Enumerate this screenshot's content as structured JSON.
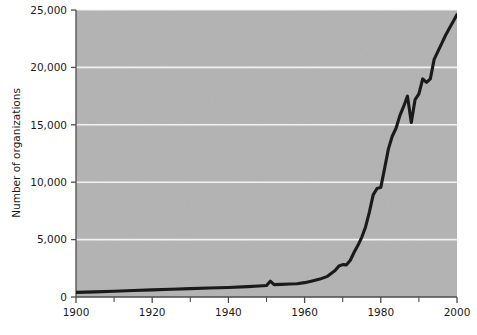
{
  "chart_data": {
    "type": "line",
    "title": "",
    "subtitle": "",
    "xlabel": "",
    "ylabel": "Number of organizations",
    "xlim": [
      1900,
      2000
    ],
    "ylim": [
      0,
      25000
    ],
    "grid": "horizontal",
    "legend": "none",
    "x_ticks_major": [
      1900,
      1920,
      1940,
      1960,
      1980,
      2000
    ],
    "x_tick_labels": [
      "1900",
      "1920",
      "1940",
      "1960",
      "1980",
      "2000"
    ],
    "x_ticks_minor": [
      1910,
      1930,
      1950,
      1970,
      1990
    ],
    "y_ticks": [
      0,
      5000,
      10000,
      15000,
      20000,
      25000
    ],
    "y_tick_labels": [
      "0",
      "5,000",
      "10,000",
      "15,000",
      "20,000",
      "25,000"
    ],
    "series": [
      {
        "name": "Number of organizations",
        "color": "#1a1a1a",
        "line_width": 3.1,
        "x": [
          1900,
          1905,
          1910,
          1915,
          1920,
          1925,
          1930,
          1935,
          1940,
          1945,
          1948,
          1950,
          1951,
          1952,
          1954,
          1956,
          1958,
          1960,
          1962,
          1964,
          1966,
          1968,
          1969,
          1970,
          1971,
          1972,
          1973,
          1974,
          1975,
          1976,
          1977,
          1978,
          1979,
          1980,
          1981,
          1982,
          1983,
          1984,
          1985,
          1986,
          1987,
          1988,
          1989,
          1990,
          1991,
          1992,
          1993,
          1994,
          1995,
          1996,
          1997,
          1998,
          1999,
          2000
        ],
        "y": [
          400,
          450,
          500,
          560,
          620,
          680,
          730,
          780,
          830,
          900,
          960,
          1000,
          1380,
          1080,
          1100,
          1130,
          1160,
          1250,
          1400,
          1560,
          1800,
          2300,
          2700,
          2820,
          2800,
          3200,
          3900,
          4500,
          5200,
          6100,
          7400,
          8900,
          9450,
          9550,
          11200,
          12900,
          14000,
          14700,
          15800,
          16600,
          17500,
          15200,
          17200,
          17700,
          19000,
          18700,
          19000,
          20700,
          21400,
          22100,
          22800,
          23400,
          24000,
          24600
        ]
      }
    ],
    "annotations": []
  },
  "axes": {
    "y_axis_title": "Number of organizations"
  },
  "colors": {
    "plot_background": "#b3b3b3",
    "page_background": "#ffffff",
    "gridline": "#f2f2f2",
    "line": "#1a1a1a",
    "axis": "#4d4d4d",
    "tick_text": "#1a1a1a"
  }
}
